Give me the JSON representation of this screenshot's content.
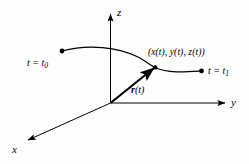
{
  "figure": {
    "kind": "vector-valued-function-space-curve-diagram",
    "background_color": "#fdfdfd",
    "stroke_color": "#000000",
    "axes": {
      "z_label": "z",
      "y_label": "y",
      "x_label": "x"
    },
    "labels": {
      "start_point": "t = t",
      "start_point_sub": "0",
      "end_point": "t = t",
      "end_point_sub": "1",
      "curve_point": "(x(t), y(t), z(t))",
      "vector_r": "r",
      "vector_arg": "(t)"
    },
    "points": {
      "origin": "(110, 103)",
      "start": "(62, 51)",
      "end": "(201, 71)",
      "curve_point": "(155, 67)"
    }
  }
}
